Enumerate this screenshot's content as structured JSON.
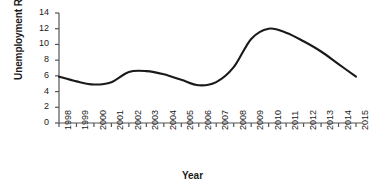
{
  "chart_data": {
    "type": "line",
    "title": "",
    "xlabel": "Year",
    "ylabel": "Unemployment Rate (%)",
    "x": [
      1998,
      1999,
      2000,
      2001,
      2002,
      2003,
      2004,
      2005,
      2006,
      2007,
      2008,
      2009,
      2010,
      2011,
      2012,
      2013,
      2014,
      2015
    ],
    "categories": [
      "1998",
      "1999",
      "2000",
      "2001",
      "2002",
      "2003",
      "2004",
      "2005",
      "2006",
      "2007",
      "2008",
      "2009",
      "2010",
      "2011",
      "2012",
      "2013",
      "2014",
      "2015"
    ],
    "values": [
      5.9,
      5.3,
      4.9,
      5.2,
      6.5,
      6.6,
      6.2,
      5.5,
      4.8,
      5.2,
      7.1,
      10.7,
      12.0,
      11.5,
      10.4,
      9.1,
      7.5,
      5.9
    ],
    "series": [
      {
        "name": "Unemployment Rate",
        "values": [
          5.9,
          5.3,
          4.9,
          5.2,
          6.5,
          6.6,
          6.2,
          5.5,
          4.8,
          5.2,
          7.1,
          10.7,
          12.0,
          11.5,
          10.4,
          9.1,
          7.5,
          5.9
        ],
        "color": "#1a1a1a"
      }
    ],
    "ylim": [
      0,
      14
    ],
    "yticks": [
      0,
      2,
      4,
      6,
      8,
      10,
      12,
      14
    ],
    "ytick_labels": [
      "0",
      "2",
      "4",
      "6",
      "8",
      "10",
      "12",
      "14"
    ],
    "xlim": [
      1998,
      2015
    ],
    "grid": false,
    "legend": false,
    "legend_position": "none",
    "line_color": "#1a1a1a",
    "axis_color": "#555555",
    "background_color": "#ffffff"
  }
}
